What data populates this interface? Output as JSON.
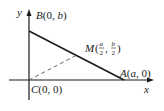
{
  "diagram": {
    "axes": {
      "x_label": "x",
      "y_label": "y"
    },
    "points": {
      "B": {
        "name": "B",
        "coords_open": "(0, ",
        "coords_var": "b",
        "coords_close": ")"
      },
      "C": {
        "name": "C",
        "coords": "(0, 0)"
      },
      "A": {
        "name": "A",
        "coords_open": "(",
        "coords_var": "a",
        "coords_close": ", 0)"
      },
      "M": {
        "name": "M",
        "frac1_num": "a",
        "frac1_den": "2",
        "frac2_num": "b",
        "frac2_den": "2"
      }
    },
    "colors": {
      "ink": "#1a1a1a",
      "dashed": "#555555"
    }
  }
}
